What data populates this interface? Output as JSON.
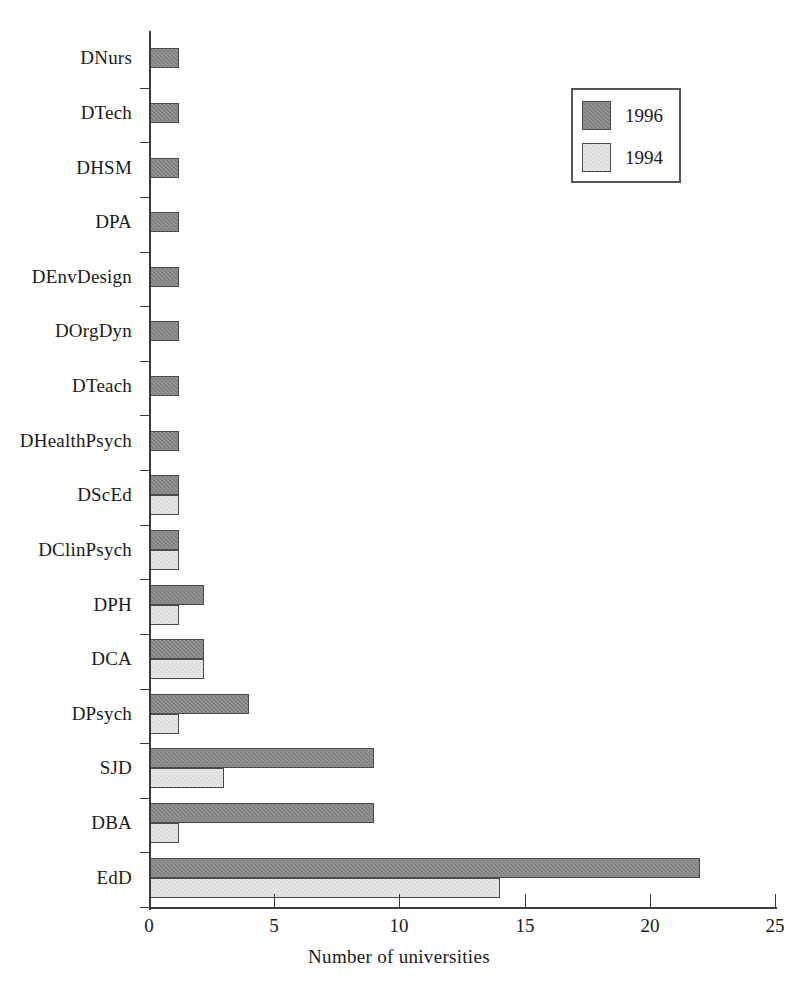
{
  "chart_data": {
    "type": "bar",
    "orientation": "horizontal",
    "title": "",
    "xlabel": "Number of universities",
    "ylabel": "",
    "xlim": [
      0,
      25
    ],
    "xticks": [
      0,
      5,
      10,
      15,
      20,
      25
    ],
    "grid": false,
    "legend_position": "top-right",
    "categories": [
      "DNurs",
      "DTech",
      "DHSM",
      "DPA",
      "DEnvDesign",
      "DOrgDyn",
      "DTeach",
      "DHealthPsych",
      "DScEd",
      "DClinPsych",
      "DPH",
      "DCA",
      "DPsych",
      "SJD",
      "DBA",
      "EdD"
    ],
    "series": [
      {
        "name": "1996",
        "color": "#808080",
        "values": [
          1.2,
          1.2,
          1.2,
          1.2,
          1.2,
          1.2,
          1.2,
          1.2,
          1.2,
          1.2,
          2.2,
          2.2,
          4,
          9,
          9,
          22
        ]
      },
      {
        "name": "1994",
        "color": "#d9d9d9",
        "values": [
          0,
          0,
          0,
          0,
          0,
          0,
          0,
          0,
          1.2,
          1.2,
          1.2,
          2.2,
          1.2,
          3,
          1.2,
          14
        ]
      }
    ]
  },
  "legend": {
    "entries": [
      {
        "label": "1996"
      },
      {
        "label": "1994"
      }
    ]
  },
  "axis": {
    "x_title": "Number of universities",
    "x_tick_labels": [
      "0",
      "5",
      "10",
      "15",
      "20",
      "25"
    ]
  }
}
